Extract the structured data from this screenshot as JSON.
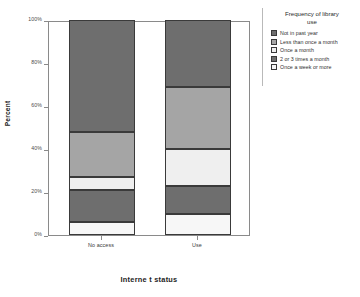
{
  "chart_data": {
    "type": "bar",
    "subtype": "stacked-percent",
    "title": "",
    "xlabel": "Interne t status",
    "ylabel": "Percent",
    "categories": [
      "No access",
      "Use"
    ],
    "ylim": [
      0,
      100
    ],
    "ytick_labels": [
      "0%",
      "20%",
      "40%",
      "60%",
      "80%",
      "100%"
    ],
    "ytick_values": [
      0,
      20,
      40,
      60,
      80,
      100
    ],
    "grid": false,
    "legend_position": "right",
    "legend_title": "Frequency of library use",
    "series": [
      {
        "name": "Not in past year",
        "color": "#6e6e6e",
        "values": [
          52,
          31
        ]
      },
      {
        "name": "Less than once a month",
        "color": "#a5a5a5",
        "values": [
          21,
          29
        ]
      },
      {
        "name": "Once a month",
        "color": "#efefef",
        "values": [
          6,
          17
        ]
      },
      {
        "name": "2 or 3 times a month",
        "color": "#6e6e6e",
        "values": [
          15,
          13
        ]
      },
      {
        "name": "Once a week or more",
        "color": "#f7f7f7",
        "values": [
          6,
          10
        ]
      }
    ]
  },
  "axes": {
    "y_title": "Percent",
    "x_title": "Interne t status",
    "y_ticks": [
      {
        "label": "100%",
        "value": 100
      },
      {
        "label": "80%",
        "value": 80
      },
      {
        "label": "60%",
        "value": 60
      },
      {
        "label": "40%",
        "value": 40
      },
      {
        "label": "20%",
        "value": 20
      },
      {
        "label": "0%",
        "value": 0
      }
    ],
    "x_ticks": [
      {
        "label": "No access"
      },
      {
        "label": "Use"
      }
    ]
  },
  "legend": {
    "title_line_1": "Frequency of library",
    "title_line_2": "use",
    "items": [
      {
        "label": "Not in past year",
        "color": "#6e6e6e"
      },
      {
        "label": "Less than once a month",
        "color": "#a5a5a5"
      },
      {
        "label": "Once a month",
        "color": "#efefef"
      },
      {
        "label": "2 or 3 times a month",
        "color": "#6e6e6e"
      },
      {
        "label": "Once a week or more",
        "color": "#f7f7f7"
      }
    ]
  }
}
